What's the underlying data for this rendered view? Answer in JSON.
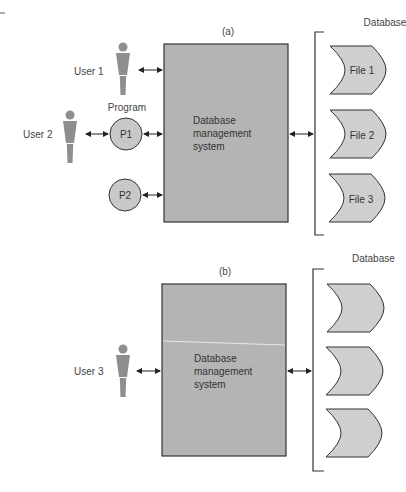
{
  "panel_a": {
    "caption": "(a)",
    "database_label": "Database",
    "dbms_lines": [
      "Database",
      "management",
      "system"
    ],
    "users": [
      "User 1",
      "User 2"
    ],
    "program_label": "Program",
    "programs": [
      "P1",
      "P2"
    ],
    "files": [
      "File 1",
      "File 2",
      "File 3"
    ]
  },
  "panel_b": {
    "caption": "(b)",
    "database_label": "Database",
    "dbms_lines": [
      "Database",
      "management",
      "system"
    ],
    "users": [
      "User 3"
    ],
    "files": [
      "",
      "",
      ""
    ]
  },
  "colors": {
    "dbms_fill": "#b4b4b4",
    "file_fill": "#cfcfcf",
    "program_fill": "#c8c8c8",
    "person_fill": "#8e8e8e",
    "stroke": "#333333"
  }
}
